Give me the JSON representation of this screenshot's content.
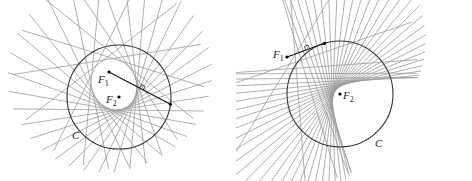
{
  "figures": [
    {
      "id": "left",
      "type": "ellipse-envelope",
      "circle": {
        "cx": 119,
        "cy": 97,
        "r": 52,
        "label": "C",
        "label_pos": [
          72,
          130
        ]
      },
      "F1": {
        "x": 109,
        "y": 72,
        "label": "F",
        "sub": "1",
        "label_pos": [
          98,
          74
        ]
      },
      "F2": {
        "x": 119,
        "y": 97,
        "label": "F",
        "sub": "2",
        "label_pos": [
          106,
          94
        ]
      },
      "highlight_angle_deg": 8,
      "line_count": 26,
      "line_half_length": 95,
      "colors": {
        "lines": "#9a9a9a",
        "circle": "#333333",
        "segment": "#111111"
      }
    },
    {
      "id": "right",
      "type": "hyperbola-envelope",
      "circle": {
        "cx": 104,
        "cy": 94,
        "r": 53,
        "label": "C",
        "label_pos": [
          139,
          138
        ]
      },
      "F1": {
        "x": 51,
        "y": 57,
        "label": "F",
        "sub": "1",
        "label_pos": [
          37,
          49
        ]
      },
      "F2": {
        "x": 104,
        "y": 94,
        "label": "F",
        "sub": "2",
        "label_pos": [
          107,
          90
        ]
      },
      "highlight_angle_deg": -107,
      "line_count": 34,
      "line_half_length": 130,
      "colors": {
        "lines": "#9a9a9a",
        "circle": "#333333",
        "segment": "#111111"
      }
    }
  ]
}
